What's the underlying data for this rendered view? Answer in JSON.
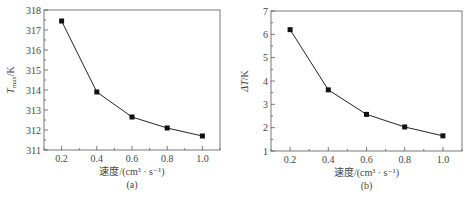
{
  "chart_data": [
    {
      "type": "line",
      "panel_label": "(a)",
      "title": "",
      "xlabel": "速度/(cm³ · s⁻¹)",
      "ylabel_main": "T",
      "ylabel_sub": "max",
      "ylabel_unit": "/K",
      "x": [
        0.2,
        0.4,
        0.6,
        0.8,
        1.0
      ],
      "series": [
        {
          "name": "Tmax",
          "values": [
            317.45,
            313.9,
            312.65,
            312.1,
            311.7
          ]
        }
      ],
      "xlim": [
        0.1,
        1.1
      ],
      "ylim": [
        311,
        318
      ],
      "xticks": [
        "0.2",
        "0.4",
        "0.6",
        "0.8",
        "1.0"
      ],
      "xtick_values": [
        0.2,
        0.4,
        0.6,
        0.8,
        1.0
      ],
      "yticks": [
        "311",
        "312",
        "313",
        "314",
        "315",
        "316",
        "317",
        "318"
      ],
      "ytick_values": [
        311,
        312,
        313,
        314,
        315,
        316,
        317,
        318
      ],
      "grid": false,
      "marker": "square",
      "line_color": "#222222"
    },
    {
      "type": "line",
      "panel_label": "(b)",
      "title": "",
      "xlabel": "速度/(cm³ · s⁻¹)",
      "ylabel_main": "ΔT",
      "ylabel_sub": "",
      "ylabel_unit": "/K",
      "x": [
        0.2,
        0.4,
        0.6,
        0.8,
        1.0
      ],
      "series": [
        {
          "name": "ΔT",
          "values": [
            6.2,
            3.62,
            2.57,
            2.03,
            1.65
          ]
        }
      ],
      "xlim": [
        0.1,
        1.1
      ],
      "ylim": [
        1,
        7
      ],
      "xticks": [
        "0.2",
        "0.4",
        "0.6",
        "0.8",
        "1.0"
      ],
      "xtick_values": [
        0.2,
        0.4,
        0.6,
        0.8,
        1.0
      ],
      "yticks": [
        "1",
        "2",
        "3",
        "4",
        "5",
        "6",
        "7"
      ],
      "ytick_values": [
        1,
        2,
        3,
        4,
        5,
        6,
        7
      ],
      "grid": false,
      "marker": "square",
      "line_color": "#222222"
    }
  ]
}
